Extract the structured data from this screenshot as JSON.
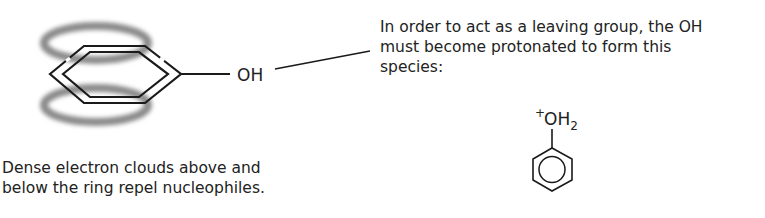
{
  "benzene_label": {
    "substituent": "OH"
  },
  "annotation_right": {
    "line1": "In order to act as a leaving group, the OH",
    "line2": "must become protonated to form this",
    "line3": "species:"
  },
  "protonated_species": {
    "charge": "+",
    "group": "OH",
    "subscript": "2"
  },
  "annotation_bottom": {
    "line1": "Dense electron clouds above and",
    "line2": "below the ring repel nucleophiles."
  },
  "colors": {
    "ink": "#1a1a1a",
    "electron_cloud": "#8a8a8a"
  }
}
